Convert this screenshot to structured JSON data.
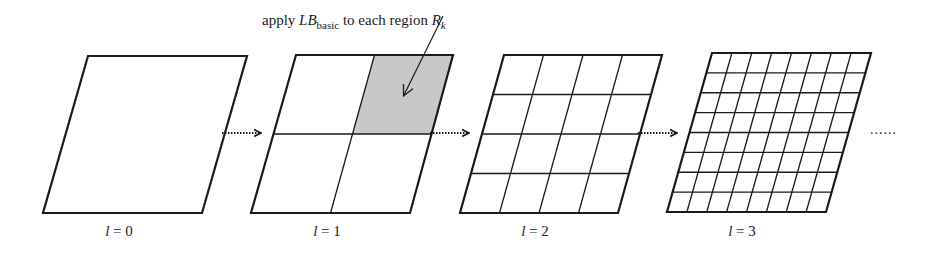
{
  "annotation": {
    "prefix": "apply ",
    "symbol_main": "LB",
    "symbol_sub": "basic",
    "middle": " to each region ",
    "region_main": "R",
    "region_sub": "k"
  },
  "colors": {
    "stroke": "#1a1a1a",
    "shade": "#c8c8c8",
    "background": "#ffffff"
  },
  "panels": [
    {
      "level_var": "l",
      "level_eq": " = ",
      "level_value": "0",
      "divisions": 1,
      "corners": {
        "tl": [
          88,
          56
        ],
        "tr": [
          247,
          56
        ],
        "br": [
          202,
          213
        ],
        "bl": [
          43,
          213
        ]
      },
      "label_x": 119
    },
    {
      "level_var": "l",
      "level_eq": " = ",
      "level_value": "1",
      "divisions": 2,
      "shaded_cell": [
        0,
        1
      ],
      "corners": {
        "tl": [
          296,
          55
        ],
        "tr": [
          453,
          55
        ],
        "br": [
          410,
          213
        ],
        "bl": [
          251,
          213
        ]
      },
      "label_x": 327
    },
    {
      "level_var": "l",
      "level_eq": " = ",
      "level_value": "2",
      "divisions": 4,
      "corners": {
        "tl": [
          504,
          55
        ],
        "tr": [
          662,
          55
        ],
        "br": [
          618,
          213
        ],
        "bl": [
          460,
          213
        ]
      },
      "label_x": 535
    },
    {
      "level_var": "l",
      "level_eq": " = ",
      "level_value": "3",
      "divisions": 8,
      "corners": {
        "tl": [
          712,
          53
        ],
        "tr": [
          871,
          53
        ],
        "br": [
          826,
          212
        ],
        "bl": [
          667,
          212
        ]
      },
      "label_x": 742
    }
  ],
  "arrows": [
    {
      "x1": 222,
      "x2": 262,
      "y": 133
    },
    {
      "x1": 430,
      "x2": 470,
      "y": 133
    },
    {
      "x1": 638,
      "x2": 678,
      "y": 133
    }
  ],
  "pointer": {
    "x1": 443,
    "y1": 16,
    "x2": 404,
    "y2": 95
  },
  "ellipsis": "......"
}
